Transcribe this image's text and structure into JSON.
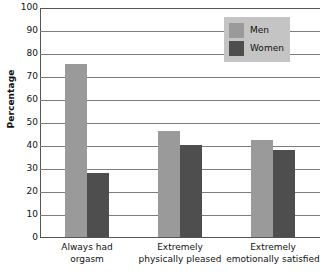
{
  "chart_data": {
    "type": "bar",
    "title": "",
    "subtitle": "",
    "xlabel": "",
    "ylabel": "Percentage",
    "ylim": [
      0,
      100
    ],
    "ytick_step": 10,
    "yticks": [
      100,
      90,
      80,
      70,
      60,
      50,
      40,
      30,
      20,
      10,
      0
    ],
    "ytick_labels": [
      "100",
      "90",
      "80",
      "70",
      "60",
      "50",
      "40",
      "30",
      "20",
      "10",
      "0"
    ],
    "grid": "horizontal",
    "legend_position": "top-right",
    "categories": [
      {
        "line1": "Always had",
        "line2": "orgasm"
      },
      {
        "line1": "Extremely",
        "line2": "physically pleased"
      },
      {
        "line1": "Extremely",
        "line2": "emotionally satisfied"
      }
    ],
    "series": [
      {
        "name": "Men",
        "color": "#9a9a9a",
        "values": [
          75,
          46,
          42
        ]
      },
      {
        "name": "Women",
        "color": "#4e4e4e",
        "values": [
          28,
          40,
          38
        ]
      }
    ]
  },
  "legend": {
    "background_color": "#c4c4c4",
    "entries": [
      {
        "label": "Men",
        "swatch": "men-swatch"
      },
      {
        "label": "Women",
        "swatch": "women-swatch"
      }
    ]
  },
  "colors": {
    "men_bar": "#9a9a9a",
    "women_bar": "#4e4e4e",
    "gridline": "#7d7d7d",
    "axis": "#555555",
    "background": "#ffffff",
    "text": "#111111"
  }
}
